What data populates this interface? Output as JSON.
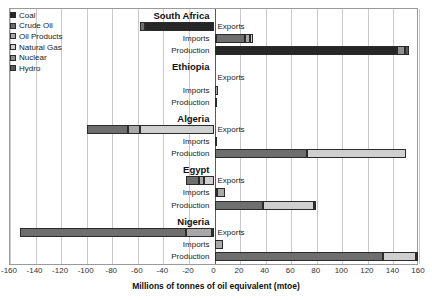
{
  "chart_data": {
    "type": "bar",
    "orientation": "horizontal",
    "stacked": true,
    "title": "",
    "xlabel": "Millions of tonnes of oil equivalent (mtoe)",
    "ylabel": "",
    "xlim": [
      -160,
      160
    ],
    "xticks": [
      -160,
      -140,
      -120,
      -100,
      -80,
      -60,
      -40,
      -20,
      0,
      20,
      40,
      60,
      80,
      100,
      120,
      140,
      160
    ],
    "xtick_labels": [
      "-160",
      "-140",
      "-120",
      "-100",
      "-80",
      "-60",
      "-40",
      "-20",
      "0",
      "20",
      "40",
      "60",
      "80",
      "100",
      "120",
      "140",
      "160"
    ],
    "grid": true,
    "grid_axis": "x",
    "legend_position": "top-left",
    "series": [
      {
        "name": "Coal",
        "color": "#262626"
      },
      {
        "name": "Crude Oil",
        "color": "#6e6e6e"
      },
      {
        "name": "Oil Products",
        "color": "#a8a8a8"
      },
      {
        "name": "Natural Gas",
        "color": "#cfcfcf"
      },
      {
        "name": "Nuclear",
        "color": "#8f8f8f"
      },
      {
        "name": "Hydro",
        "color": "#5a5a5a"
      }
    ],
    "row_categories": [
      "Exports",
      "Imports",
      "Production"
    ],
    "groups": [
      {
        "name": "South Africa",
        "rows": [
          {
            "category": "Exports",
            "total": -58,
            "segments": [
              {
                "series": "Coal",
                "value": -54
              },
              {
                "series": "Crude Oil",
                "value": -4
              }
            ]
          },
          {
            "category": "Imports",
            "total": 30,
            "segments": [
              {
                "series": "Coal",
                "value": 1
              },
              {
                "series": "Crude Oil",
                "value": 23
              },
              {
                "series": "Oil Products",
                "value": 4
              },
              {
                "series": "Natural Gas",
                "value": 2
              }
            ]
          },
          {
            "category": "Production",
            "total": 152,
            "segments": [
              {
                "series": "Coal",
                "value": 143
              },
              {
                "series": "Nuclear",
                "value": 6
              },
              {
                "series": "Hydro",
                "value": 3
              }
            ]
          }
        ]
      },
      {
        "name": "Ethiopia",
        "rows": [
          {
            "category": "Exports",
            "total": 0,
            "segments": []
          },
          {
            "category": "Imports",
            "total": 3,
            "segments": [
              {
                "series": "Oil Products",
                "value": 3
              }
            ]
          },
          {
            "category": "Production",
            "total": 1,
            "segments": [
              {
                "series": "Hydro",
                "value": 1
              }
            ]
          }
        ]
      },
      {
        "name": "Algeria",
        "rows": [
          {
            "category": "Exports",
            "total": -100,
            "segments": [
              {
                "series": "Natural Gas",
                "value": -58
              },
              {
                "series": "Oil Products",
                "value": -10
              },
              {
                "series": "Crude Oil",
                "value": -32
              }
            ]
          },
          {
            "category": "Imports",
            "total": 2,
            "segments": [
              {
                "series": "Oil Products",
                "value": 2
              }
            ]
          },
          {
            "category": "Production",
            "total": 150,
            "segments": [
              {
                "series": "Crude Oil",
                "value": 72
              },
              {
                "series": "Natural Gas",
                "value": 78
              }
            ]
          }
        ]
      },
      {
        "name": "Egypt",
        "rows": [
          {
            "category": "Exports",
            "total": -22,
            "segments": [
              {
                "series": "Natural Gas",
                "value": -8
              },
              {
                "series": "Oil Products",
                "value": -4
              },
              {
                "series": "Crude Oil",
                "value": -10
              }
            ]
          },
          {
            "category": "Imports",
            "total": 8,
            "segments": [
              {
                "series": "Crude Oil",
                "value": 2
              },
              {
                "series": "Oil Products",
                "value": 6
              }
            ]
          },
          {
            "category": "Production",
            "total": 79,
            "segments": [
              {
                "series": "Crude Oil",
                "value": 38
              },
              {
                "series": "Natural Gas",
                "value": 40
              },
              {
                "series": "Hydro",
                "value": 1
              }
            ]
          }
        ]
      },
      {
        "name": "Nigeria",
        "rows": [
          {
            "category": "Exports",
            "total": -152,
            "segments": [
              {
                "series": "Natural Gas",
                "value": -2
              },
              {
                "series": "Oil Products",
                "value": -20
              },
              {
                "series": "Crude Oil",
                "value": -130
              }
            ]
          },
          {
            "category": "Imports",
            "total": 7,
            "segments": [
              {
                "series": "Oil Products",
                "value": 7
              }
            ]
          },
          {
            "category": "Production",
            "total": 159,
            "segments": [
              {
                "series": "Crude Oil",
                "value": 132
              },
              {
                "series": "Natural Gas",
                "value": 26
              },
              {
                "series": "Hydro",
                "value": 1
              }
            ]
          }
        ]
      }
    ]
  },
  "legend": {
    "items": [
      {
        "label": "Coal",
        "color": "#262626"
      },
      {
        "label": "Crude Oil",
        "color": "#6e6e6e"
      },
      {
        "label": "Oil Products",
        "color": "#a8a8a8"
      },
      {
        "label": "Natural Gas",
        "color": "#cfcfcf"
      },
      {
        "label": "Nuclear",
        "color": "#8f8f8f"
      },
      {
        "label": "Hydro",
        "color": "#5a5a5a"
      }
    ]
  },
  "axis": {
    "x_title": "Millions of tonnes of oil equivalent (mtoe)"
  }
}
